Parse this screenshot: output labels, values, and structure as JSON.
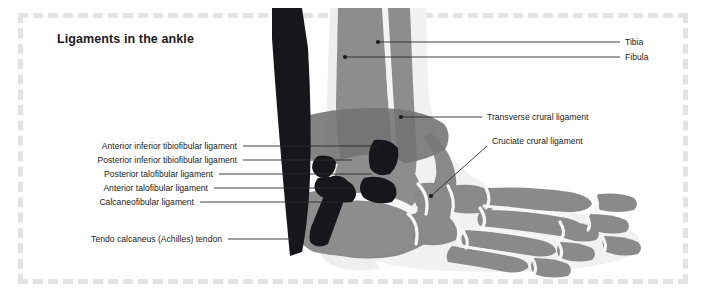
{
  "title": "Ligaments in the ankle",
  "labels_left": [
    {
      "text": "Anterior inferior tibiofibular ligament",
      "right_edge": 237,
      "y": 146
    },
    {
      "text": "Posterior inferior tibiofibular ligament",
      "right_edge": 237,
      "y": 160
    },
    {
      "text": "Posterior talofibular ligament",
      "right_edge": 213,
      "y": 174
    },
    {
      "text": "Anterior talofibular ligament",
      "right_edge": 208,
      "y": 188
    },
    {
      "text": "Calcaneofibular ligament",
      "right_edge": 194,
      "y": 202
    },
    {
      "text": "Tendo calcaneus (Achilles) tendon",
      "right_edge": 222,
      "y": 239
    }
  ],
  "labels_right": [
    {
      "text": "Tibia",
      "left_edge": 625,
      "y": 42
    },
    {
      "text": "Fibula",
      "left_edge": 625,
      "y": 57
    },
    {
      "text": "Transverse crural ligament",
      "left_edge": 487,
      "y": 117
    },
    {
      "text": "Cruciate crural ligament",
      "left_edge": 492,
      "y": 141
    }
  ],
  "colors": {
    "bone": "#8d8d8d",
    "bone_shadow": "#7b7b7b",
    "ligament_dark": "#6f6f6f",
    "black": "#15151a",
    "soft_tissue": "#f0f0f0",
    "leader": "#2a2a2a",
    "dashed_frame": "#e3e3e3",
    "text": "#1b1b1b"
  },
  "chart_data": {
    "type": "diagram",
    "title": "Ligaments in the ankle",
    "view": "lateral ankle and foot, skeletal",
    "annotations": [
      "Tibia",
      "Fibula",
      "Transverse crural ligament",
      "Cruciate crural ligament",
      "Anterior inferior tibiofibular ligament",
      "Posterior inferior tibiofibular ligament",
      "Posterior talofibular ligament",
      "Anterior talofibular ligament",
      "Calcaneofibular ligament",
      "Tendo calcaneus (Achilles) tendon"
    ]
  }
}
